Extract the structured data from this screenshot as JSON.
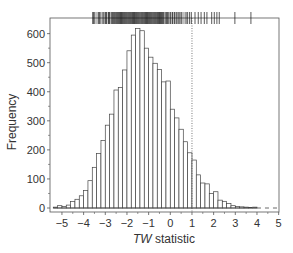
{
  "chart_data": {
    "type": "bar",
    "subtype": "histogram",
    "title": "",
    "xlabel": "TW statistic",
    "xlabel_italic_part": "TW",
    "xlabel_rest": " statistic",
    "ylabel": "Frequency",
    "xlim": [
      -5.4,
      5.1
    ],
    "ylim": [
      -15,
      650
    ],
    "xticks": [
      -5,
      -4,
      -3,
      -2,
      -1,
      0,
      1,
      2,
      3,
      4,
      5
    ],
    "xtick_labels": [
      "−5",
      "−4",
      "−3",
      "−2",
      "−1",
      "0",
      "1",
      "2",
      "3",
      "4",
      "5"
    ],
    "yticks": [
      0,
      100,
      200,
      300,
      400,
      500,
      600
    ],
    "ytick_labels": [
      "0",
      "100",
      "200",
      "300",
      "400",
      "500",
      "600"
    ],
    "grid": false,
    "legend": null,
    "bin_width": 0.2,
    "bin_left_edges": [
      -5.4,
      -5.2,
      -5.0,
      -4.8,
      -4.6,
      -4.4,
      -4.2,
      -4.0,
      -3.8,
      -3.6,
      -3.4,
      -3.2,
      -3.0,
      -2.8,
      -2.6,
      -2.4,
      -2.2,
      -2.0,
      -1.8,
      -1.6,
      -1.4,
      -1.2,
      -1.0,
      -0.8,
      -0.6,
      -0.4,
      -0.2,
      0.0,
      0.2,
      0.4,
      0.6,
      0.8,
      1.0,
      1.2,
      1.4,
      1.6,
      1.8,
      2.0,
      2.2,
      2.4,
      2.6,
      2.8,
      3.0,
      3.2,
      3.4,
      3.6,
      3.8
    ],
    "values": [
      3,
      8,
      5,
      10,
      22,
      30,
      42,
      60,
      94,
      140,
      188,
      232,
      285,
      323,
      406,
      415,
      475,
      541,
      595,
      618,
      610,
      550,
      519,
      498,
      477,
      434,
      437,
      340,
      310,
      271,
      228,
      190,
      165,
      114,
      86,
      83,
      50,
      56,
      27,
      23,
      16,
      8,
      5,
      4,
      3,
      2,
      3
    ],
    "reference_line": {
      "x": 1,
      "style": "dotted"
    },
    "tail_dashed_line": {
      "from_x": 4.0,
      "to_x": 5.0,
      "y": 0,
      "style": "dashed"
    },
    "rug": {
      "position": "top",
      "dense_range": [
        -3.6,
        0.7
      ],
      "dense_values": [
        -3.57,
        -3.52,
        -3.3,
        -3.25,
        -3.1,
        -3.0,
        -2.95,
        -2.85,
        -2.8,
        -2.7,
        -2.65,
        -2.6,
        -2.55,
        -2.5,
        -2.45,
        -2.4,
        -2.35,
        -2.3,
        -2.25,
        -2.2,
        -2.15,
        -2.1,
        -2.05,
        -2.0,
        -1.95,
        -1.9,
        -1.85,
        -1.8,
        -1.75,
        -1.7,
        -1.65,
        -1.6,
        -1.55,
        -1.5,
        -1.45,
        -1.4,
        -1.35,
        -1.3,
        -1.25,
        -1.2,
        -1.15,
        -1.1,
        -1.05,
        -1.0,
        -0.95,
        -0.9,
        -0.85,
        -0.8,
        -0.75,
        -0.7,
        -0.65,
        -0.6,
        -0.55,
        -0.5,
        -0.45,
        -0.4,
        -0.35,
        -0.3,
        -0.2,
        -0.15,
        -0.1,
        0.0,
        0.1,
        0.2,
        0.3,
        0.4,
        0.5
      ],
      "sparse_values": [
        0.73,
        0.8,
        0.89,
        0.97,
        1.14,
        1.29,
        1.42,
        1.57,
        1.69,
        1.91,
        2.03,
        2.15,
        2.26,
        2.98,
        3.72
      ]
    }
  },
  "colors": {
    "axis": "#555555",
    "bar_fill": "#ffffff",
    "bar_stroke": "#444444",
    "rug": "#111111",
    "text": "#333333"
  }
}
